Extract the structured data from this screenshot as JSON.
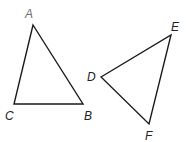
{
  "diagram": {
    "triangles": [
      {
        "name": "ABC",
        "vertices": [
          {
            "label": "A",
            "x": 33,
            "y": 25,
            "lx": 29,
            "ly": 18
          },
          {
            "label": "B",
            "x": 83,
            "y": 104,
            "lx": 88,
            "ly": 119
          },
          {
            "label": "C",
            "x": 14,
            "y": 104,
            "lx": 9,
            "ly": 119
          }
        ]
      },
      {
        "name": "DEF",
        "vertices": [
          {
            "label": "D",
            "x": 101,
            "y": 77,
            "lx": 92,
            "ly": 81
          },
          {
            "label": "E",
            "x": 171,
            "y": 35,
            "lx": 175,
            "ly": 31
          },
          {
            "label": "F",
            "x": 149,
            "y": 124,
            "lx": 149,
            "ly": 139
          }
        ]
      }
    ],
    "stroke_color": "#1a1a1a"
  }
}
